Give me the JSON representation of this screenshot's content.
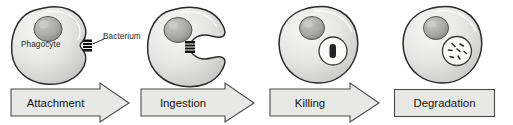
{
  "figure": {
    "width": 513,
    "height": 125,
    "background": "#ffffff"
  },
  "palette": {
    "cell_fill_light": "#f2f2f0",
    "cell_fill_mid": "#dcdcda",
    "cell_fill_dark": "#c2c2c0",
    "cell_outline": "#2b2b2b",
    "nucleus_light": "#b9b9b7",
    "nucleus_dark": "#8e8e8c",
    "nucleus_outline": "#4a4a4a",
    "bacterium_fill": "#1a1a1a",
    "vacuole_fill": "#fbfbfa",
    "vacuole_outline": "#3a3a3a",
    "band_fill": "#e8e8e6",
    "band_outline": "#4a4a4a",
    "text": "#1c1c1c",
    "leader_line": "#2b2b2b"
  },
  "stages": [
    {
      "id": "attachment",
      "label": "Attachment",
      "band_shape": "arrow",
      "cell_label": "Phagocyte",
      "callout_label": "Bacterium",
      "has_bacterium_outside": true,
      "has_vacuole": false,
      "vacuole_contents": "none"
    },
    {
      "id": "ingestion",
      "label": "Ingestion",
      "band_shape": "arrow",
      "cell_label": "",
      "callout_label": "",
      "has_bacterium_outside": true,
      "has_vacuole": false,
      "vacuole_contents": "none"
    },
    {
      "id": "killing",
      "label": "Killing",
      "band_shape": "arrow",
      "cell_label": "",
      "callout_label": "",
      "has_bacterium_outside": false,
      "has_vacuole": true,
      "vacuole_contents": "intact-rod"
    },
    {
      "id": "degradation",
      "label": "Degradation",
      "band_shape": "rectangle",
      "cell_label": "",
      "callout_label": "",
      "has_bacterium_outside": false,
      "has_vacuole": true,
      "vacuole_contents": "fragments"
    }
  ]
}
